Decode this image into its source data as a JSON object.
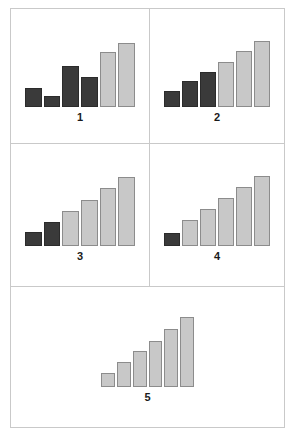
{
  "figure": {
    "background": "#ffffff",
    "border_color": "#c9c9c9",
    "dark_bar_color": "#3a3a3a",
    "light_bar_color": "#c8c8c8",
    "bar_outline_color": "#8c8c8c"
  },
  "panels": [
    {
      "label": "1"
    },
    {
      "label": "2"
    },
    {
      "label": "3"
    },
    {
      "label": "4"
    },
    {
      "label": "5"
    }
  ],
  "chart_data": [
    {
      "type": "bar",
      "title": "1",
      "xlabel": "",
      "ylabel": "",
      "grid": false,
      "legend": "none",
      "ylim": [
        0,
        100
      ],
      "categories": [
        "1",
        "2",
        "3",
        "4",
        "5",
        "6"
      ],
      "values": [
        25,
        14,
        52,
        38,
        70,
        82
      ],
      "bar_colors": [
        "#3a3a3a",
        "#3a3a3a",
        "#3a3a3a",
        "#3a3a3a",
        "#c8c8c8",
        "#c8c8c8"
      ],
      "dark_count": 4,
      "light_count": 2,
      "monotonic": false
    },
    {
      "type": "bar",
      "title": "2",
      "xlabel": "",
      "ylabel": "",
      "grid": false,
      "legend": "none",
      "ylim": [
        0,
        100
      ],
      "categories": [
        "1",
        "2",
        "3",
        "4",
        "5",
        "6"
      ],
      "values": [
        20,
        33,
        45,
        58,
        72,
        84
      ],
      "bar_colors": [
        "#3a3a3a",
        "#3a3a3a",
        "#3a3a3a",
        "#c8c8c8",
        "#c8c8c8",
        "#c8c8c8"
      ],
      "dark_count": 3,
      "light_count": 3,
      "monotonic": true
    },
    {
      "type": "bar",
      "title": "3",
      "xlabel": "",
      "ylabel": "",
      "grid": false,
      "legend": "none",
      "ylim": [
        0,
        100
      ],
      "categories": [
        "1",
        "2",
        "3",
        "4",
        "5",
        "6"
      ],
      "values": [
        18,
        30,
        44,
        58,
        72,
        86
      ],
      "bar_colors": [
        "#3a3a3a",
        "#3a3a3a",
        "#c8c8c8",
        "#c8c8c8",
        "#c8c8c8",
        "#c8c8c8"
      ],
      "dark_count": 2,
      "light_count": 4,
      "monotonic": true
    },
    {
      "type": "bar",
      "title": "4",
      "xlabel": "",
      "ylabel": "",
      "grid": false,
      "legend": "none",
      "ylim": [
        0,
        100
      ],
      "categories": [
        "1",
        "2",
        "3",
        "4",
        "5",
        "6"
      ],
      "values": [
        16,
        32,
        46,
        60,
        74,
        88
      ],
      "bar_colors": [
        "#3a3a3a",
        "#c8c8c8",
        "#c8c8c8",
        "#c8c8c8",
        "#c8c8c8",
        "#c8c8c8"
      ],
      "dark_count": 1,
      "light_count": 5,
      "monotonic": true
    },
    {
      "type": "bar",
      "title": "5",
      "xlabel": "",
      "ylabel": "",
      "grid": false,
      "legend": "none",
      "ylim": [
        0,
        100
      ],
      "categories": [
        "1",
        "2",
        "3",
        "4",
        "5",
        "6"
      ],
      "values": [
        17,
        31,
        45,
        58,
        73,
        87
      ],
      "bar_colors": [
        "#c8c8c8",
        "#c8c8c8",
        "#c8c8c8",
        "#c8c8c8",
        "#c8c8c8",
        "#c8c8c8"
      ],
      "dark_count": 0,
      "light_count": 6,
      "monotonic": true
    }
  ]
}
